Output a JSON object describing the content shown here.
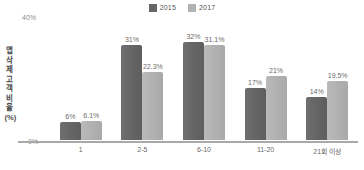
{
  "chart_data": {
    "type": "bar",
    "title": "",
    "subtitle": "",
    "xlabel": "",
    "ylabel": "앱 삭제 고객 비율(%)",
    "categories": [
      "1",
      "2-5",
      "6-10",
      "11-20",
      "21회 이상"
    ],
    "series": [
      {
        "name": "2015",
        "color": "#666666",
        "values": [
          6,
          31,
          32,
          17,
          14
        ],
        "labels": [
          "6%",
          "31%",
          "32%",
          "17%",
          "14%"
        ]
      },
      {
        "name": "2017",
        "color": "#b2b2b2",
        "values": [
          6.1,
          22.3,
          31.1,
          21,
          19.5
        ],
        "labels": [
          "6.1%",
          "22.3%",
          "31.1%",
          "21%",
          "19.5%"
        ]
      }
    ],
    "ylim": [
      0,
      40
    ],
    "ytick_labels": [
      "40%",
      "0%"
    ],
    "grid": false,
    "legend_position": "top-center"
  },
  "axis": {
    "y_top_tick": "40%",
    "y_bottom_tick": "0%",
    "y_title": "앱 삭제 고객 비율(%)"
  },
  "legend": {
    "items": [
      {
        "label": "2015",
        "color": "#666666"
      },
      {
        "label": "2017",
        "color": "#b2b2b2"
      }
    ]
  }
}
